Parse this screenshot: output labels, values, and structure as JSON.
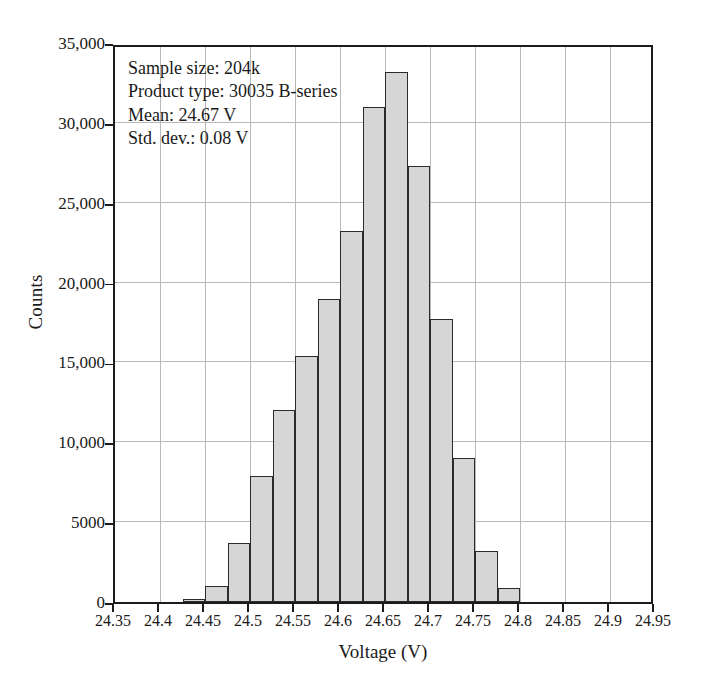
{
  "chart_data": {
    "type": "bar",
    "title": "",
    "xlabel": "Voltage (V)",
    "ylabel": "Counts",
    "xlim": [
      24.35,
      24.95
    ],
    "ylim": [
      0,
      35000
    ],
    "grid": true,
    "legend": "none",
    "bin_width": 0.025,
    "xticks": [
      "24.35",
      "24.4",
      "24.45",
      "24.5",
      "24.55",
      "24.6",
      "24.65",
      "24.7",
      "24.75",
      "24.8",
      "24.85",
      "24.9",
      "24.95"
    ],
    "xtick_values": [
      24.35,
      24.4,
      24.45,
      24.5,
      24.55,
      24.6,
      24.65,
      24.7,
      24.75,
      24.8,
      24.85,
      24.9,
      24.95
    ],
    "yticks": [
      "0",
      "5000",
      "10,000",
      "15,000",
      "20,000",
      "25,000",
      "30,000",
      "35,000"
    ],
    "ytick_values": [
      0,
      5000,
      10000,
      15000,
      20000,
      25000,
      30000,
      35000
    ],
    "bin_edges": [
      24.35,
      24.375,
      24.4,
      24.425,
      24.45,
      24.475,
      24.5,
      24.525,
      24.55,
      24.575,
      24.6,
      24.625,
      24.65,
      24.675,
      24.7,
      24.725,
      24.75,
      24.775,
      24.8,
      24.825,
      24.85,
      24.875,
      24.9,
      24.925,
      24.95
    ],
    "categories": [
      "24.35-24.375",
      "24.375-24.4",
      "24.4-24.425",
      "24.425-24.45",
      "24.45-24.475",
      "24.475-24.5",
      "24.5-24.525",
      "24.525-24.55",
      "24.55-24.575",
      "24.575-24.6",
      "24.6-24.625",
      "24.625-24.65",
      "24.65-24.675",
      "24.675-24.7",
      "24.7-24.725",
      "24.725-24.75",
      "24.75-24.775",
      "24.775-24.8",
      "24.8-24.825",
      "24.825-24.85",
      "24.85-24.875",
      "24.875-24.9",
      "24.9-24.925",
      "24.925-24.95"
    ],
    "values": [
      0,
      0,
      0,
      200,
      1000,
      3700,
      7900,
      12000,
      15400,
      19000,
      23200,
      31000,
      33200,
      27300,
      17700,
      9000,
      3200,
      900,
      0,
      0,
      0,
      0,
      0,
      0
    ],
    "bar_fill": "#d6d6d6",
    "bar_edge": "#2b2b2b",
    "grid_color": "#b9b9b9",
    "axis_color": "#1c1c1c"
  },
  "annotation": {
    "line1": "Sample size: 204k",
    "line2": "Product type: 30035 B-series",
    "line3": "Mean: 24.67 V",
    "line4": "Std. dev.: 0.08 V"
  }
}
